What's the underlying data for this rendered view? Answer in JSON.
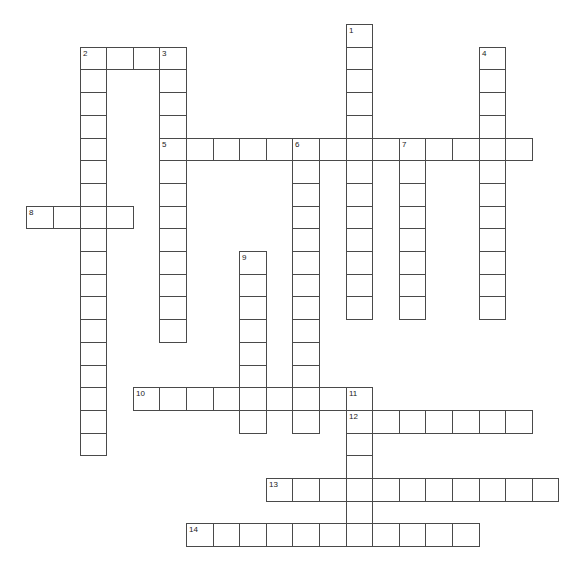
{
  "puzzle": {
    "type": "crossword",
    "grid": {
      "origin_x": 26.3,
      "origin_y": 24,
      "cell_w": 26.6,
      "cell_h": 22.7
    },
    "line_color": "#4a4a4a",
    "entries": [
      {
        "number": "1",
        "direction": "down",
        "row": 0,
        "col": 12,
        "length": 13
      },
      {
        "number": "2",
        "direction": "across",
        "row": 1,
        "col": 2,
        "length": 4
      },
      {
        "number": "2",
        "direction": "down",
        "row": 1,
        "col": 2,
        "length": 18
      },
      {
        "number": "3",
        "direction": "down",
        "row": 1,
        "col": 5,
        "length": 13
      },
      {
        "number": "4",
        "direction": "down",
        "row": 1,
        "col": 17,
        "length": 12
      },
      {
        "number": "5",
        "direction": "across",
        "row": 5,
        "col": 5,
        "length": 14
      },
      {
        "number": "6",
        "direction": "down",
        "row": 5,
        "col": 10,
        "length": 13
      },
      {
        "number": "7",
        "direction": "down",
        "row": 5,
        "col": 14,
        "length": 8
      },
      {
        "number": "8",
        "direction": "across",
        "row": 8,
        "col": 0,
        "length": 4
      },
      {
        "number": "9",
        "direction": "down",
        "row": 10,
        "col": 8,
        "length": 8
      },
      {
        "number": "10",
        "direction": "across",
        "row": 16,
        "col": 4,
        "length": 9
      },
      {
        "number": "11",
        "direction": "down",
        "row": 16,
        "col": 12,
        "length": 7
      },
      {
        "number": "12",
        "direction": "across",
        "row": 17,
        "col": 12,
        "length": 7
      },
      {
        "number": "13",
        "direction": "across",
        "row": 20,
        "col": 9,
        "length": 11
      },
      {
        "number": "14",
        "direction": "across",
        "row": 22,
        "col": 6,
        "length": 11
      }
    ]
  }
}
